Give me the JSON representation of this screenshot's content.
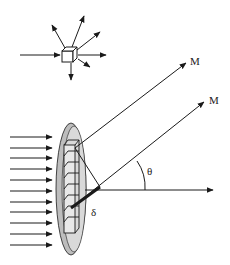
{
  "diagram": {
    "labels": {
      "ray_upper": "M",
      "ray_lower": "M",
      "angle": "θ",
      "path_difference": "δ"
    },
    "incoming_arrow_count": 11,
    "scatter_inset": {
      "incoming_arrows": 1,
      "outgoing_arrows": 7
    },
    "colors": {
      "line": "#1a1a1a",
      "disc_fill": "#d9d9d9",
      "disc_edge": "#bdbdbd",
      "background": "#ffffff"
    }
  }
}
